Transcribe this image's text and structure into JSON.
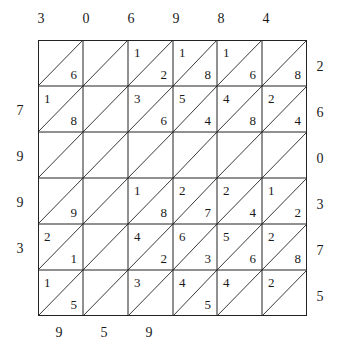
{
  "multiplicand_digits": [
    "3",
    "0",
    "6",
    "9",
    "8",
    "4"
  ],
  "multiplier_digits": [
    "2",
    "6",
    "0",
    "3",
    "7",
    "5"
  ],
  "left_digits": [
    "",
    "7",
    "9",
    "9",
    "3",
    ""
  ],
  "bottom_digits": [
    "9",
    "5",
    "9",
    "",
    "",
    ""
  ],
  "cells": [
    [
      {
        "tens": "",
        "ones": "6"
      },
      {
        "tens": "",
        "ones": ""
      },
      {
        "tens": "1",
        "ones": "2"
      },
      {
        "tens": "1",
        "ones": "8"
      },
      {
        "tens": "1",
        "ones": "6"
      },
      {
        "tens": "",
        "ones": "8"
      }
    ],
    [
      {
        "tens": "1",
        "ones": "8"
      },
      {
        "tens": "",
        "ones": ""
      },
      {
        "tens": "3",
        "ones": "6"
      },
      {
        "tens": "5",
        "ones": "4"
      },
      {
        "tens": "4",
        "ones": "8"
      },
      {
        "tens": "2",
        "ones": "4"
      }
    ],
    [
      {
        "tens": "",
        "ones": ""
      },
      {
        "tens": "",
        "ones": ""
      },
      {
        "tens": "",
        "ones": ""
      },
      {
        "tens": "",
        "ones": ""
      },
      {
        "tens": "",
        "ones": ""
      },
      {
        "tens": "",
        "ones": ""
      }
    ],
    [
      {
        "tens": "",
        "ones": "9"
      },
      {
        "tens": "",
        "ones": ""
      },
      {
        "tens": "1",
        "ones": "8"
      },
      {
        "tens": "2",
        "ones": "7"
      },
      {
        "tens": "2",
        "ones": "4"
      },
      {
        "tens": "1",
        "ones": "2"
      }
    ],
    [
      {
        "tens": "2",
        "ones": "1"
      },
      {
        "tens": "",
        "ones": ""
      },
      {
        "tens": "4",
        "ones": "2"
      },
      {
        "tens": "6",
        "ones": "3"
      },
      {
        "tens": "5",
        "ones": "6"
      },
      {
        "tens": "2",
        "ones": "8"
      }
    ],
    [
      {
        "tens": "1",
        "ones": "5"
      },
      {
        "tens": "",
        "ones": ""
      },
      {
        "tens": "3",
        "ones": ""
      },
      {
        "tens": "4",
        "ones": "5"
      },
      {
        "tens": "4",
        "ones": ""
      },
      {
        "tens": "2",
        "ones": ""
      }
    ]
  ]
}
